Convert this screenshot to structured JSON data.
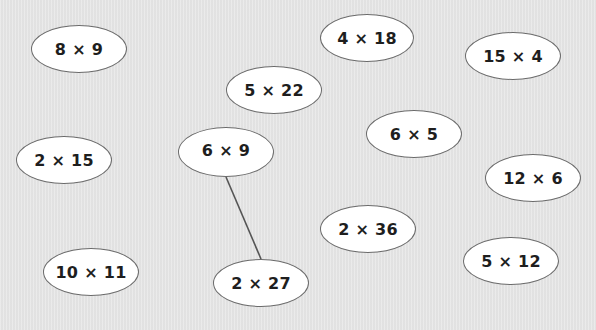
{
  "activity": {
    "background_color": "#e6e6e6",
    "oval_fill": "#ffffff",
    "oval_border": "#6b6b6b",
    "line_color": "#555555",
    "ovals": [
      {
        "id": "o1",
        "label": "8 × 9",
        "cx": 79,
        "cy": 49,
        "w": 96,
        "h": 48
      },
      {
        "id": "o2",
        "label": "4 × 18",
        "cx": 367,
        "cy": 38,
        "w": 94,
        "h": 48
      },
      {
        "id": "o3",
        "label": "15 × 4",
        "cx": 513,
        "cy": 56,
        "w": 96,
        "h": 48
      },
      {
        "id": "o4",
        "label": "5 × 22",
        "cx": 274,
        "cy": 90,
        "w": 96,
        "h": 48
      },
      {
        "id": "o5",
        "label": "2 × 15",
        "cx": 64,
        "cy": 160,
        "w": 96,
        "h": 48
      },
      {
        "id": "o6",
        "label": "6 × 9",
        "cx": 226,
        "cy": 152,
        "w": 96,
        "h": 50
      },
      {
        "id": "o7",
        "label": "6 × 5",
        "cx": 414,
        "cy": 134,
        "w": 96,
        "h": 48
      },
      {
        "id": "o8",
        "label": "12 × 6",
        "cx": 533,
        "cy": 178,
        "w": 96,
        "h": 48
      },
      {
        "id": "o9",
        "label": "2 × 36",
        "cx": 368,
        "cy": 229,
        "w": 96,
        "h": 48
      },
      {
        "id": "o10",
        "label": "10 × 11",
        "cx": 91,
        "cy": 272,
        "w": 96,
        "h": 48
      },
      {
        "id": "o11",
        "label": "2 × 27",
        "cx": 261,
        "cy": 283,
        "w": 96,
        "h": 48
      },
      {
        "id": "o12",
        "label": "5 × 12",
        "cx": 511,
        "cy": 261,
        "w": 96,
        "h": 48
      }
    ],
    "connections": [
      {
        "from": "6 × 9",
        "to": "2 × 27",
        "x1": 226,
        "y1": 177,
        "x2": 261,
        "y2": 259
      }
    ]
  }
}
